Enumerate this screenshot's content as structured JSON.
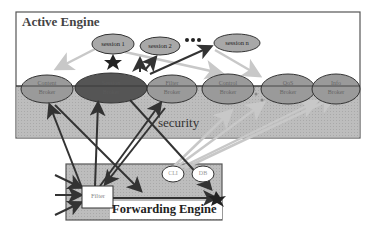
{
  "diagram": {
    "active_engine": {
      "title": "Active Engine",
      "security_label": "security",
      "sessions": [
        {
          "label": "session 1"
        },
        {
          "label": "session 2"
        },
        {
          "label": "session n"
        }
      ],
      "ellipsis": "•••",
      "brokers": [
        {
          "line1": "Content",
          "line2": "Broker"
        },
        {
          "line1": "Session",
          "line2": "Broker"
        },
        {
          "line1": "Filter",
          "line2": "Broker"
        },
        {
          "line1": "Control",
          "line2": "Broker"
        },
        {
          "line1": "QoS",
          "line2": "Broker"
        },
        {
          "line1": "Info",
          "line2": "Broker"
        }
      ]
    },
    "forwarding_engine": {
      "title": "Forwarding Engine",
      "filter_label": "Filter",
      "cli_label": "CLI",
      "db_label": "DB"
    },
    "colors": {
      "frame": "#444444",
      "security_fill": "#b8b8b8",
      "broker_fill": "#9a9a9a",
      "session_broker_fill": "#555555",
      "session_fill": "#a8a8a8",
      "arrow_dark": "#333333",
      "arrow_light": "#c8c8c8"
    }
  }
}
